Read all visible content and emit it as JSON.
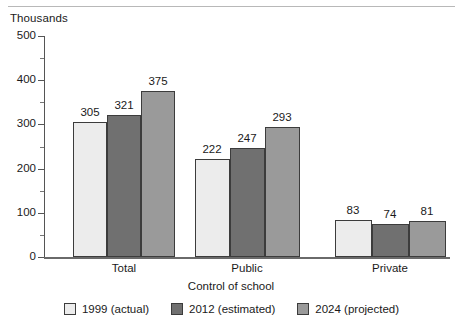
{
  "chart_data": {
    "type": "bar",
    "title": "",
    "units_caption": "Thousands",
    "xlabel": "Control of school",
    "ylabel": "Thousands",
    "categories": [
      "Total",
      "Public",
      "Private"
    ],
    "series": [
      {
        "name": "1999 (actual)",
        "color": "#ececec",
        "values": [
          305,
          222,
          83
        ]
      },
      {
        "name": "2012 (estimated)",
        "color": "#707070",
        "values": [
          321,
          247,
          74
        ]
      },
      {
        "name": "2024 (projected)",
        "color": "#9a9a9a",
        "values": [
          375,
          293,
          81
        ]
      }
    ],
    "ylim": [
      0,
      500
    ],
    "yticks": [
      0,
      100,
      200,
      300,
      400,
      500
    ],
    "ytick_labels": [
      "0",
      "100",
      "200",
      "300",
      "400",
      "500"
    ],
    "yminor_ticks": [
      50,
      150,
      250,
      350,
      450
    ],
    "grid": false,
    "legend_position": "bottom",
    "data_labels": [
      [
        "305",
        "321",
        "375"
      ],
      [
        "222",
        "247",
        "293"
      ],
      [
        "83",
        "74",
        "81"
      ]
    ]
  },
  "axis": {
    "units_caption": "Thousands",
    "x_title": "Control of school",
    "tick_labels": [
      "500",
      "400",
      "300",
      "200",
      "100",
      "0"
    ]
  },
  "groups": [
    {
      "label": "Total"
    },
    {
      "label": "Public"
    },
    {
      "label": "Private"
    }
  ],
  "legend": {
    "items": [
      {
        "label": "1999 (actual)"
      },
      {
        "label": "2012 (estimated)"
      },
      {
        "label": "2024 (projected)"
      }
    ]
  },
  "colors": {
    "series_1999": "#ececec",
    "series_2012": "#707070",
    "series_2024": "#9a9a9a",
    "axis": "#555555",
    "bar_outline": "#3c3c3c",
    "text": "#1a1a1a",
    "rule": "#b8b8b8"
  }
}
